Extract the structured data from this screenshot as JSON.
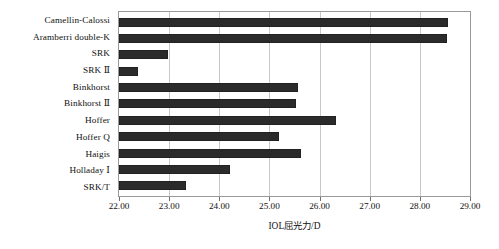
{
  "chart_data": {
    "type": "bar",
    "orientation": "horizontal",
    "title": "",
    "xlabel": "IOL屈光力/D",
    "ylabel": "",
    "xlim": [
      22.0,
      29.0
    ],
    "xticks": [
      "22.00",
      "23.00",
      "24.00",
      "25.00",
      "26.00",
      "27.00",
      "28.00",
      "29.00"
    ],
    "xtick_values": [
      22.0,
      23.0,
      24.0,
      25.0,
      26.0,
      27.0,
      28.0,
      29.0
    ],
    "grid": "vertical",
    "legend": "none",
    "bar_color": "#2b2b2b",
    "categories": [
      "Camellin-Calossi",
      "Aramberri double-K",
      "SRK",
      "SRK Ⅱ",
      "Binkhorst",
      "Binkhorst Ⅱ",
      "Hoffer",
      "Hoffer Q",
      "Haigis",
      "Holladay Ⅰ",
      "SRK/T"
    ],
    "values": [
      28.57,
      28.55,
      22.97,
      22.38,
      25.56,
      25.52,
      26.32,
      25.19,
      25.62,
      24.22,
      23.33
    ]
  }
}
